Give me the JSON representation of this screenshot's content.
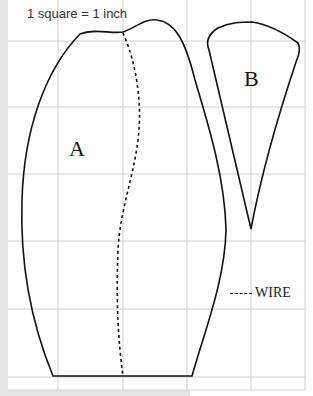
{
  "figure": {
    "scale_label": "1 square = 1 inch",
    "shapes": [
      {
        "label": "A"
      },
      {
        "label": "B"
      }
    ],
    "legend": {
      "line_style": "dashed",
      "label": "WIRE"
    },
    "colors": {
      "grid": "#d0d0d0",
      "outline": "#111111",
      "strip": "#e6e6e6"
    }
  }
}
